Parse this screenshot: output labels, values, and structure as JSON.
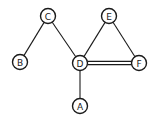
{
  "diagram": {
    "type": "undirected-graph",
    "nodes": [
      {
        "id": "A",
        "label": "A",
        "x": 80,
        "y": 106
      },
      {
        "id": "B",
        "label": "B",
        "x": 20,
        "y": 62
      },
      {
        "id": "C",
        "label": "C",
        "x": 48,
        "y": 16
      },
      {
        "id": "D",
        "label": "D",
        "x": 80,
        "y": 63
      },
      {
        "id": "E",
        "label": "E",
        "x": 109,
        "y": 16
      },
      {
        "id": "F",
        "label": "F",
        "x": 139,
        "y": 63
      }
    ],
    "edges": [
      {
        "from": "C",
        "to": "B",
        "style": "single"
      },
      {
        "from": "C",
        "to": "D",
        "style": "single"
      },
      {
        "from": "E",
        "to": "D",
        "style": "single"
      },
      {
        "from": "E",
        "to": "F",
        "style": "single"
      },
      {
        "from": "D",
        "to": "F",
        "style": "double"
      },
      {
        "from": "D",
        "to": "A",
        "style": "single"
      }
    ],
    "node_radius": 7.5,
    "colors": {
      "stroke": "#1a1a1a",
      "fill": "#ffffff",
      "background": "#ffffff"
    }
  }
}
